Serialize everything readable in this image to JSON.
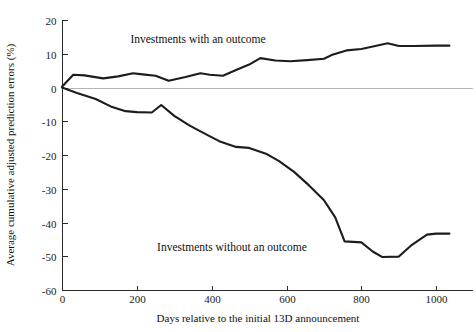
{
  "chart_data": {
    "type": "line",
    "title": "",
    "xlabel": "Days relative to the initial 13D announcement",
    "ylabel": "Average cumulative adjusted prediction errors (%)",
    "xlim": [
      0,
      1050
    ],
    "ylim": [
      -60,
      20
    ],
    "xticks": [
      0,
      200,
      400,
      600,
      800,
      1000
    ],
    "xtick_labels": [
      "0",
      "200",
      "400",
      "600",
      "800",
      "1000"
    ],
    "yticks": [
      20,
      10,
      0,
      -10,
      -20,
      -30,
      -40,
      -50,
      -60
    ],
    "ytick_labels": [
      "20",
      "10",
      "0",
      "-10",
      "-20",
      "-30",
      "-40",
      "-50",
      "-60"
    ],
    "grid": false,
    "legend_position": "inline-annotation",
    "zero_reference_line": true,
    "series": [
      {
        "name": "Investments with an outcome",
        "color": "#1c1c1c",
        "x": [
          0,
          30,
          60,
          110,
          150,
          190,
          215,
          250,
          285,
          330,
          370,
          395,
          430,
          465,
          500,
          530,
          570,
          610,
          655,
          700,
          720,
          760,
          800,
          840,
          870,
          900,
          940,
          1000,
          1035
        ],
        "y": [
          0.2,
          3.8,
          3.6,
          2.7,
          3.3,
          4.2,
          3.9,
          3.5,
          2.0,
          3.1,
          4.2,
          3.8,
          3.5,
          5.2,
          6.8,
          8.7,
          8.0,
          7.8,
          8.1,
          8.5,
          9.6,
          11.0,
          11.4,
          12.4,
          13.1,
          12.3,
          12.3,
          12.4,
          12.4
        ]
      },
      {
        "name": "Investments without an outcome",
        "color": "#1c1c1c",
        "x": [
          0,
          40,
          90,
          130,
          170,
          200,
          240,
          265,
          300,
          340,
          380,
          420,
          465,
          500,
          545,
          580,
          620,
          660,
          700,
          730,
          755,
          800,
          830,
          855,
          900,
          935,
          975,
          1000,
          1035
        ],
        "y": [
          0.0,
          -1.6,
          -3.4,
          -5.6,
          -7.0,
          -7.3,
          -7.4,
          -5.2,
          -8.4,
          -11.2,
          -13.6,
          -15.9,
          -17.6,
          -17.9,
          -19.6,
          -21.8,
          -25.0,
          -29.0,
          -33.4,
          -38.5,
          -45.6,
          -45.9,
          -48.6,
          -50.2,
          -50.1,
          -46.6,
          -43.6,
          -43.3,
          -43.3
        ]
      }
    ],
    "annotations": [
      {
        "text": "Investments with an outcome",
        "x_px": 198,
        "y_px": 43,
        "anchor": "middle"
      },
      {
        "text": "Investments without an outcome",
        "x_px": 232,
        "y_px": 251,
        "anchor": "middle"
      }
    ]
  },
  "geometry": {
    "plot_left_px": 62,
    "plot_right_px": 455,
    "plot_top_px": 20,
    "plot_bottom_px": 290
  }
}
